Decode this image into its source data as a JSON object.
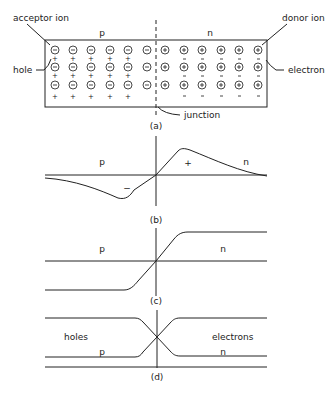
{
  "panel_a": {
    "caption": "(a)",
    "region_p": "p",
    "region_n": "n",
    "labels": {
      "acceptor_ion": "acceptor  ion",
      "donor_ion": "donor  ion",
      "hole": "hole",
      "electron": "electron",
      "junction": "junction"
    },
    "p_side": {
      "ion_symbol": "⊖",
      "carrier_symbol": "+",
      "columns": 6,
      "rows": 3,
      "carriers_per_row": 5
    },
    "n_side": {
      "ion_symbol": "⊕",
      "carrier_symbol": "−",
      "columns": 6,
      "rows": 3,
      "carriers_per_row": 6
    }
  },
  "panel_b": {
    "caption": "(b)",
    "region_p": "p",
    "region_n": "n",
    "sign_neg": "−",
    "sign_pos": "+"
  },
  "panel_c": {
    "caption": "(c)",
    "region_p": "p",
    "region_n": "n"
  },
  "panel_d": {
    "caption": "(d)",
    "label_left": "holes",
    "label_right": "electrons",
    "region_p": "p",
    "region_n": "n"
  }
}
